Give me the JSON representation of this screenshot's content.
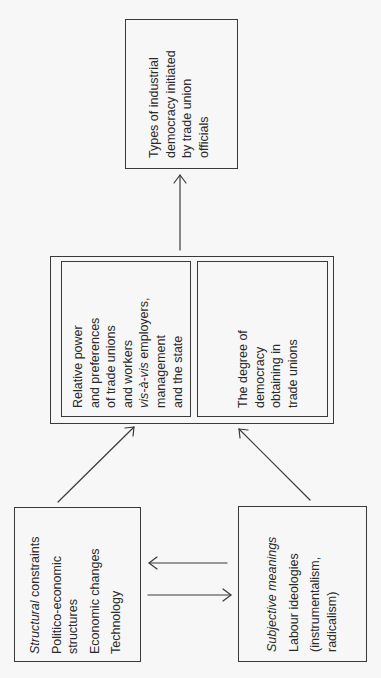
{
  "diagram": {
    "outcome_box": {
      "lines": [
        "Types of industrial",
        "democracy initiated",
        "by trade union",
        "officials"
      ]
    },
    "mediating_box": {
      "power_box": {
        "lines": [
          "Relative power",
          "and preferences",
          "of trade unions",
          "and workers"
        ],
        "line5_italic": "vis-à-vis",
        "line5_rest": " employers,",
        "lines_after": [
          "management",
          "and the state"
        ]
      },
      "democracy_box": {
        "lines": [
          "The degree of",
          "democracy",
          "obtaining in",
          "trade unions"
        ]
      }
    },
    "structural_box": {
      "title_italic": "Structural",
      "title_rest": " constraints",
      "items": [
        "Politico-economic",
        "structures",
        "Economic changes",
        "Technology"
      ]
    },
    "subjective_box": {
      "title": "Subjective meanings",
      "items": [
        "Labour ideologies",
        "(instrumentalism,",
        "radicalism)"
      ]
    },
    "arrows": [
      {
        "from": "mediating_box",
        "to": "outcome_box"
      },
      {
        "from": "structural_box",
        "to": "mediating_box"
      },
      {
        "from": "subjective_box",
        "to": "mediating_box"
      },
      {
        "from": "subjective_box",
        "to": "structural_box"
      },
      {
        "from": "structural_box",
        "to": "subjective_box"
      }
    ],
    "colors": {
      "line": "#3a3a3a",
      "text": "#2a2a2a",
      "background": "#f7f7f7"
    }
  }
}
